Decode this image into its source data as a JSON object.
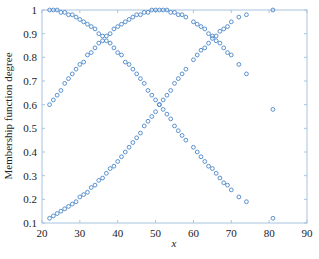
{
  "chart_data": {
    "type": "scatter",
    "title": "",
    "xlabel": "x",
    "ylabel": "Membership function degree",
    "xlim": [
      20,
      90
    ],
    "ylim": [
      0.1,
      1.0
    ],
    "xticks": [
      "20",
      "30",
      "40",
      "50",
      "60",
      "70",
      "80",
      "90"
    ],
    "yticks": [
      "0.1",
      "0.2",
      "0.3",
      "0.4",
      "0.5",
      "0.6",
      "0.7",
      "0.8",
      "0.9",
      "1"
    ],
    "grid": false,
    "legend": null,
    "marker": "open circle",
    "color": "#4a86c8",
    "x": [
      22,
      23,
      24,
      25,
      26,
      27,
      28,
      29,
      30,
      31,
      32,
      33,
      34,
      35,
      36,
      37,
      38,
      39,
      40,
      41,
      42,
      43,
      44,
      45,
      46,
      47,
      48,
      49,
      50,
      51,
      52,
      53,
      54,
      55,
      56,
      57,
      58,
      60,
      61,
      62,
      63,
      64,
      65,
      66,
      67,
      68,
      69,
      70,
      72,
      74,
      81
    ],
    "series": [
      {
        "name": "low",
        "center": 22,
        "sigma": 28.7,
        "values": [
          1.0,
          1.0,
          1.0,
          0.99,
          0.99,
          0.98,
          0.98,
          0.97,
          0.96,
          0.95,
          0.94,
          0.93,
          0.92,
          0.9,
          0.89,
          0.87,
          0.86,
          0.84,
          0.82,
          0.81,
          0.78,
          0.77,
          0.75,
          0.73,
          0.71,
          0.69,
          0.66,
          0.64,
          0.62,
          0.6,
          0.58,
          0.56,
          0.54,
          0.51,
          0.49,
          0.47,
          0.45,
          0.42,
          0.4,
          0.38,
          0.36,
          0.34,
          0.33,
          0.31,
          0.29,
          0.27,
          0.26,
          0.24,
          0.21,
          0.19,
          0.12
        ]
      },
      {
        "name": "medium",
        "center": 51,
        "sigma": 28.7,
        "values": [
          0.6,
          0.62,
          0.64,
          0.66,
          0.69,
          0.71,
          0.73,
          0.75,
          0.77,
          0.78,
          0.81,
          0.82,
          0.84,
          0.86,
          0.87,
          0.89,
          0.9,
          0.92,
          0.93,
          0.94,
          0.95,
          0.96,
          0.97,
          0.98,
          0.98,
          0.99,
          0.99,
          1.0,
          1.0,
          1.0,
          1.0,
          1.0,
          0.99,
          0.99,
          0.98,
          0.98,
          0.97,
          0.95,
          0.94,
          0.93,
          0.92,
          0.9,
          0.89,
          0.87,
          0.86,
          0.84,
          0.82,
          0.81,
          0.77,
          0.73,
          0.58
        ]
      },
      {
        "name": "high",
        "center": 81,
        "sigma": 28.7,
        "values": [
          0.12,
          0.13,
          0.14,
          0.15,
          0.16,
          0.17,
          0.18,
          0.19,
          0.21,
          0.22,
          0.23,
          0.25,
          0.26,
          0.28,
          0.29,
          0.31,
          0.33,
          0.34,
          0.36,
          0.38,
          0.4,
          0.42,
          0.44,
          0.46,
          0.48,
          0.51,
          0.53,
          0.55,
          0.57,
          0.6,
          0.62,
          0.64,
          0.66,
          0.69,
          0.71,
          0.73,
          0.75,
          0.79,
          0.81,
          0.83,
          0.84,
          0.86,
          0.88,
          0.89,
          0.91,
          0.92,
          0.93,
          0.95,
          0.97,
          0.98,
          1.0
        ]
      }
    ]
  }
}
